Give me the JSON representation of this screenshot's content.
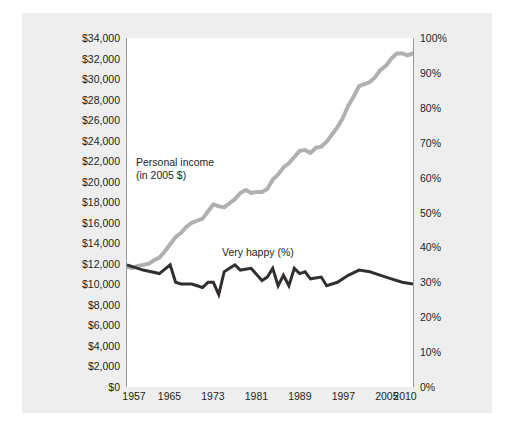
{
  "figure": {
    "background_color": "#ffffff",
    "panel_color": "#eeeeee",
    "plot_background": "#ffffff",
    "axis_color": "#9a9a9a"
  },
  "annotations": {
    "income_line1": "Personal income",
    "income_line2": "(in 2005 $)",
    "happy": "Very happy (%)"
  },
  "chart_data": {
    "type": "line",
    "title": "",
    "subtitle": "",
    "xlabel": "",
    "ylabel": "",
    "grid": false,
    "legend_position": "inline-annotation",
    "xlim": [
      1957,
      2010
    ],
    "x_tick_labels": [
      "1957",
      "1965",
      "1973",
      "1981",
      "1989",
      "1997",
      "2005",
      "2010"
    ],
    "x_ticks": [
      1957,
      1965,
      1973,
      1981,
      1989,
      1997,
      2005,
      2010
    ],
    "left_axis": {
      "label": "Personal income (in 2005 $)",
      "ylim": [
        0,
        34000
      ],
      "tick_values": [
        0,
        2000,
        4000,
        6000,
        8000,
        10000,
        12000,
        14000,
        16000,
        18000,
        20000,
        22000,
        24000,
        26000,
        28000,
        30000,
        32000,
        34000
      ],
      "tick_labels": [
        "$0",
        "$2,000",
        "$4,000",
        "$6,000",
        "$8,000",
        "$10,000",
        "$12,000",
        "$14,000",
        "$16,000",
        "$18,000",
        "$20,000",
        "$22,000",
        "$24,000",
        "$26,000",
        "$28,000",
        "$30,000",
        "$32,000",
        "$34,000"
      ]
    },
    "right_axis": {
      "label": "Very happy (%)",
      "ylim": [
        0,
        100
      ],
      "tick_values": [
        0,
        10,
        20,
        30,
        40,
        50,
        60,
        70,
        80,
        90,
        100
      ],
      "tick_labels": [
        "0%",
        "10%",
        "20%",
        "30%",
        "40%",
        "50%",
        "60%",
        "70%",
        "80%",
        "90%",
        "100%"
      ]
    },
    "series": [
      {
        "name": "Personal income (in 2005 $)",
        "axis": "left",
        "color": "#b0b0b0",
        "linewidth": 4,
        "x": [
          1957,
          1958,
          1959,
          1960,
          1961,
          1962,
          1963,
          1964,
          1965,
          1966,
          1967,
          1968,
          1969,
          1970,
          1971,
          1972,
          1973,
          1974,
          1975,
          1976,
          1977,
          1978,
          1979,
          1980,
          1981,
          1982,
          1983,
          1984,
          1985,
          1986,
          1987,
          1988,
          1989,
          1990,
          1991,
          1992,
          1993,
          1994,
          1995,
          1996,
          1997,
          1998,
          1999,
          2000,
          2001,
          2002,
          2003,
          2004,
          2005,
          2006,
          2007,
          2008,
          2009,
          2010
        ],
        "values": [
          11700,
          11600,
          11800,
          11900,
          12000,
          12350,
          12600,
          13200,
          13900,
          14600,
          15000,
          15600,
          16000,
          16200,
          16400,
          17100,
          17800,
          17600,
          17500,
          17900,
          18300,
          18900,
          19200,
          18900,
          19000,
          19000,
          19300,
          20200,
          20700,
          21400,
          21800,
          22400,
          23000,
          23100,
          22800,
          23300,
          23400,
          23900,
          24600,
          25300,
          26200,
          27400,
          28300,
          29300,
          29500,
          29700,
          30200,
          30900,
          31300,
          32000,
          32500,
          32500,
          32300,
          32500
        ]
      },
      {
        "name": "Very happy (%)",
        "axis": "right",
        "color": "#332f2e",
        "linewidth": 3,
        "x": [
          1957,
          1960,
          1963,
          1965,
          1966,
          1967,
          1968,
          1969,
          1970,
          1971,
          1972,
          1973,
          1974,
          1975,
          1976,
          1977,
          1978,
          1980,
          1982,
          1983,
          1984,
          1985,
          1986,
          1987,
          1988,
          1989,
          1990,
          1991,
          1993,
          1994,
          1996,
          1998,
          2000,
          2002,
          2004,
          2006,
          2008,
          2010
        ],
        "values": [
          35,
          33.5,
          32.5,
          35,
          30,
          29.5,
          29.5,
          29.5,
          29,
          28.5,
          30,
          30,
          26.5,
          33,
          34,
          35,
          33.5,
          34,
          30.5,
          31.5,
          34,
          29,
          32,
          29,
          34,
          32.5,
          33,
          31,
          31.5,
          29,
          30,
          32,
          33.5,
          33,
          32,
          31,
          30,
          29.5
        ]
      }
    ]
  }
}
